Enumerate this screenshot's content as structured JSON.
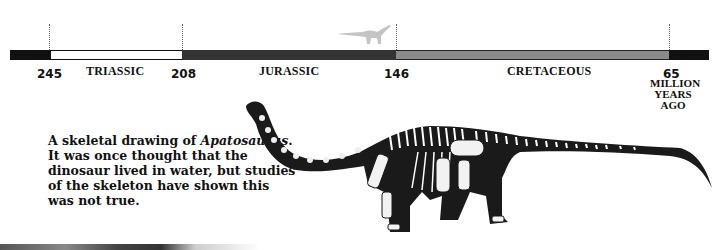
{
  "timeline": {
    "periods": [
      {
        "name": "TRIASSIC",
        "start": 245,
        "end": 208,
        "color": "#ffffff"
      },
      {
        "name": "JURASSIC",
        "start": 208,
        "end": 146,
        "color": "#333333"
      },
      {
        "name": "CRETACEOUS",
        "start": 146,
        "end": 65,
        "color": "#8a8a8a"
      }
    ],
    "boundaries": [
      "245",
      "208",
      "146",
      "65"
    ],
    "unit_label": {
      "line1": "MILLION",
      "line2": "YEARS",
      "line3": "AGO"
    }
  },
  "caption": {
    "lead": "A skeletal drawing of",
    "species": "Apatosaurus",
    "rest": ". It was once thought that the dinosaur lived in water, but studies of the skeleton have shown this was not true."
  },
  "images": {
    "marker": "sauropod-silhouette-icon",
    "illustration": "apatosaurus-skeleton"
  }
}
